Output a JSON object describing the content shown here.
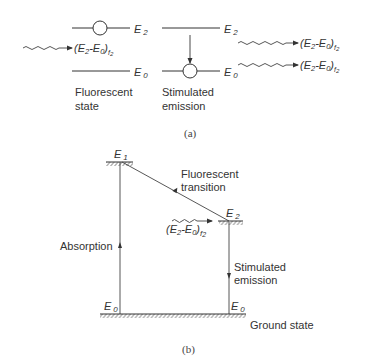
{
  "panel_a": {
    "caption": "(a)",
    "fluorescent_state": {
      "level_upper": "E",
      "level_upper_sub": "2",
      "level_lower": "E",
      "level_lower_sub": "0",
      "incoming_photon_label": "(E",
      "label_line1": "Fluorescent",
      "label_line2": "state"
    },
    "stimulated_emission": {
      "level_upper": "E",
      "level_upper_sub": "2",
      "level_lower": "E",
      "level_lower_sub": "0",
      "label_line1": "Stimulated",
      "label_line2": "emission"
    },
    "photon_label": {
      "open": "(E",
      "sub2": "2",
      "dash": "-E",
      "sub0": "0",
      "close": ")",
      "subf": "f",
      "subf2": "2"
    }
  },
  "panel_b": {
    "caption": "(b)",
    "level_E1": {
      "main": "E",
      "sub": "1"
    },
    "level_E2": {
      "main": "E",
      "sub": "2"
    },
    "level_E0_left": {
      "main": "E",
      "sub": "0"
    },
    "level_E0_right": {
      "main": "E",
      "sub": "0"
    },
    "fluorescent_transition": {
      "line1": "Fluorescent",
      "line2": "transition"
    },
    "absorption": "Absorption",
    "stimulated_emission": {
      "line1": "Stimulated",
      "line2": "emission"
    },
    "ground_state": "Ground state"
  }
}
